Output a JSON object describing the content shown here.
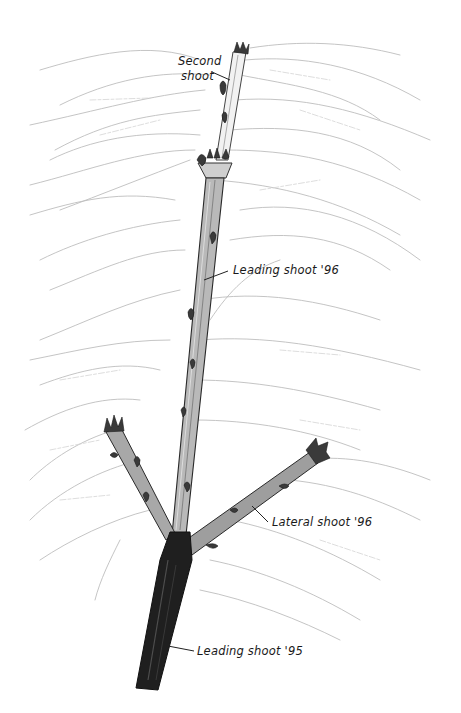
{
  "illustration": {
    "subject": "pencil sketch of a shoot with buds and faint leaf outlines",
    "colors": {
      "background": "#ffffff",
      "ink": "#1a1a1a",
      "stem_dark": "#1e1e1e",
      "stem_light": "#8a8a8a",
      "leaf_sketch": "#bdbdbd"
    }
  },
  "labels": {
    "second_shoot_line1": "Second",
    "second_shoot_line2": "shoot",
    "leading_shoot_96": "Leading shoot '96",
    "lateral_shoot_96": "Lateral shoot '96",
    "leading_shoot_95": "Leading shoot '95"
  }
}
